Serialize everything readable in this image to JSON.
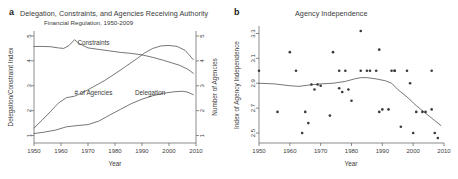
{
  "figure": {
    "panels": [
      {
        "letter": "a",
        "title": "Delegation, Constraints, and Agencies Receiving Authority",
        "subtitle": "Financial Regulation, 1950-2009"
      },
      {
        "letter": "b",
        "title": "Agency Independence",
        "subtitle": ""
      }
    ]
  },
  "chart_data": [
    {
      "type": "line",
      "panel": "a",
      "title": "Delegation, Constraints, and Agencies Receiving Authority",
      "subtitle": "Financial Regulation, 1950-2009",
      "xlabel": "Year",
      "ylabel": "Delegation/Constraint Index",
      "y2label": "Number of Agencies",
      "xlim": [
        1950,
        2010
      ],
      "ylim": [
        0.7,
        5.2
      ],
      "y2lim": [
        0.7,
        5.2
      ],
      "xticks": [
        1950,
        1960,
        1970,
        1980,
        1990,
        2000,
        2010
      ],
      "yticks": [
        1,
        2,
        3,
        4,
        5
      ],
      "y2ticks": [
        1,
        2,
        3,
        4,
        5
      ],
      "grid": false,
      "legend": "inline-annotations",
      "series": [
        {
          "name": "Constraints",
          "axis": "left",
          "label_x": 1972,
          "label_y": 4.62,
          "x": [
            1950,
            1953,
            1956,
            1959,
            1961,
            1963,
            1965,
            1967,
            1970,
            1974,
            1978,
            1982,
            1986,
            1990,
            1994,
            1998,
            2001,
            2004,
            2007,
            2009
          ],
          "values": [
            4.58,
            4.58,
            4.57,
            4.52,
            4.5,
            4.62,
            4.85,
            4.68,
            4.52,
            4.46,
            4.4,
            4.34,
            4.3,
            4.24,
            4.14,
            4.02,
            3.92,
            3.82,
            3.66,
            3.5
          ]
        },
        {
          "name": "# of Agencies",
          "axis": "right",
          "label_x": 1972,
          "label_y": 2.62,
          "x": [
            1950,
            1953,
            1956,
            1959,
            1962,
            1965,
            1968,
            1972,
            1976,
            1980,
            1984,
            1988,
            1991,
            1994,
            1997,
            2000,
            2003,
            2006,
            2009
          ],
          "values": [
            1.3,
            1.62,
            1.95,
            2.3,
            2.52,
            2.58,
            2.72,
            2.96,
            3.2,
            3.48,
            3.78,
            4.08,
            4.32,
            4.5,
            4.6,
            4.62,
            4.58,
            4.42,
            4.05
          ]
        },
        {
          "name": "Delegation",
          "axis": "left",
          "label_x": 1993,
          "label_y": 2.62,
          "x": [
            1950,
            1954,
            1958,
            1962,
            1966,
            1970,
            1974,
            1978,
            1982,
            1986,
            1990,
            1994,
            1998,
            2002,
            2005,
            2007,
            2009
          ],
          "values": [
            1.08,
            1.14,
            1.22,
            1.35,
            1.4,
            1.44,
            1.58,
            1.82,
            2.05,
            2.28,
            2.46,
            2.6,
            2.7,
            2.76,
            2.78,
            2.74,
            2.64
          ]
        }
      ]
    },
    {
      "type": "scatter",
      "panel": "b",
      "title": "Agency Independence",
      "xlabel": "Year",
      "ylabel": "Index of Agency Independence",
      "xlim": [
        1950,
        2010
      ],
      "ylim": [
        2.42,
        3.36
      ],
      "xticks": [
        1950,
        1960,
        1970,
        1980,
        1990,
        2000,
        2010
      ],
      "yticks": [
        2.5,
        2.7,
        2.9,
        3.1,
        3.3
      ],
      "grid": false,
      "points": [
        {
          "x": 1950,
          "y": 3.0
        },
        {
          "x": 1956,
          "y": 2.67
        },
        {
          "x": 1960,
          "y": 3.15
        },
        {
          "x": 1962,
          "y": 3.0
        },
        {
          "x": 1964,
          "y": 2.5
        },
        {
          "x": 1965,
          "y": 2.67
        },
        {
          "x": 1966,
          "y": 2.58
        },
        {
          "x": 1967,
          "y": 2.89
        },
        {
          "x": 1968,
          "y": 2.85
        },
        {
          "x": 1969,
          "y": 2.89
        },
        {
          "x": 1970,
          "y": 2.88
        },
        {
          "x": 1973,
          "y": 2.64
        },
        {
          "x": 1974,
          "y": 3.15
        },
        {
          "x": 1976,
          "y": 3.0
        },
        {
          "x": 1976,
          "y": 2.86
        },
        {
          "x": 1977,
          "y": 2.83
        },
        {
          "x": 1978,
          "y": 3.0
        },
        {
          "x": 1979,
          "y": 2.85
        },
        {
          "x": 1980,
          "y": 2.76
        },
        {
          "x": 1983,
          "y": 3.32
        },
        {
          "x": 1983,
          "y": 3.0
        },
        {
          "x": 1985,
          "y": 3.0
        },
        {
          "x": 1986,
          "y": 3.0
        },
        {
          "x": 1988,
          "y": 3.0
        },
        {
          "x": 1989,
          "y": 3.17
        },
        {
          "x": 1989,
          "y": 2.67
        },
        {
          "x": 1990,
          "y": 2.69
        },
        {
          "x": 1992,
          "y": 2.69
        },
        {
          "x": 1993,
          "y": 3.0
        },
        {
          "x": 1994,
          "y": 3.0
        },
        {
          "x": 1994,
          "y": 3.0
        },
        {
          "x": 1996,
          "y": 2.55
        },
        {
          "x": 1998,
          "y": 3.0
        },
        {
          "x": 1999,
          "y": 2.9
        },
        {
          "x": 2000,
          "y": 2.5
        },
        {
          "x": 2001,
          "y": 2.67
        },
        {
          "x": 2003,
          "y": 2.67
        },
        {
          "x": 2004,
          "y": 2.67
        },
        {
          "x": 2006,
          "y": 3.0
        },
        {
          "x": 2006,
          "y": 2.69
        },
        {
          "x": 2007,
          "y": 2.5
        },
        {
          "x": 2008,
          "y": 2.46
        }
      ],
      "trend_line": {
        "name": "smoothed-trend",
        "x": [
          1950,
          1955,
          1960,
          1963,
          1966,
          1970,
          1974,
          1978,
          1981,
          1983,
          1985,
          1988,
          1991,
          1993,
          1995,
          1998,
          2001,
          2004,
          2007,
          2009
        ],
        "values": [
          2.9,
          2.895,
          2.88,
          2.875,
          2.885,
          2.895,
          2.9,
          2.915,
          2.935,
          2.945,
          2.945,
          2.935,
          2.92,
          2.9,
          2.85,
          2.79,
          2.72,
          2.66,
          2.6,
          2.56
        ]
      }
    }
  ]
}
